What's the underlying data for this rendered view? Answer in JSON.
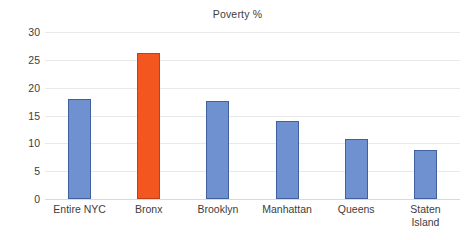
{
  "chart_data": {
    "type": "bar",
    "title": "Poverty %",
    "xlabel": "",
    "ylabel": "",
    "categories": [
      "Entire NYC",
      "Bronx",
      "Brooklyn",
      "Manhattan",
      "Queens",
      "Staten Island"
    ],
    "values": [
      18.0,
      26.3,
      17.6,
      14.0,
      10.8,
      8.8
    ],
    "ylim": [
      0,
      30
    ],
    "yticks": [
      0,
      5,
      10,
      15,
      20,
      25,
      30
    ],
    "ytick_labels": [
      "0",
      "5",
      "10",
      "15",
      "20",
      "25",
      "30"
    ],
    "grid": true,
    "legend": false,
    "legend_position": "none",
    "bar_colors": [
      "#7091cf",
      "#f4561f",
      "#7091cf",
      "#7091cf",
      "#7091cf",
      "#7091cf"
    ],
    "bar_border_colors": [
      "#40609e",
      "#c0401a",
      "#40609e",
      "#40609e",
      "#40609e",
      "#40609e"
    ],
    "highlight_category": "Bronx",
    "accent_color": "#f4561f",
    "series_color": "#7091cf",
    "gridline_color": "#e9e9e9",
    "background_color": "#ffffff",
    "category_label_lines": [
      [
        "Entire NYC"
      ],
      [
        "Bronx"
      ],
      [
        "Brooklyn"
      ],
      [
        "Manhattan"
      ],
      [
        "Queens"
      ],
      [
        "Staten",
        "Island"
      ]
    ]
  }
}
